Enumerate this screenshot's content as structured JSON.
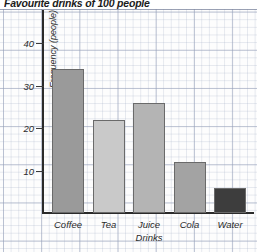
{
  "title": "Favourite drinks of 100 people",
  "chart_data": {
    "type": "bar",
    "title": "Favourite drinks of 100 people",
    "xlabel": "",
    "ylabel": "Frequency (people)",
    "categories": [
      "Coffee",
      "Tea",
      "Juice Drinks",
      "Cola",
      "Water"
    ],
    "values": [
      34,
      22,
      26,
      12,
      6
    ],
    "ylim": [
      0,
      45
    ],
    "ytick_labels": [
      "10",
      "20",
      "30",
      "40"
    ],
    "yticks": [
      10,
      20,
      30,
      40
    ],
    "minor_gridline_step": 2,
    "major_gridline_step": 10,
    "grid": true,
    "legend": false,
    "bar_colors": [
      "#9a9a9a",
      "#c9c9c9",
      "#b4b4b4",
      "#a3a3a3",
      "#3d3d3d"
    ],
    "bar_border_color": "#6a6a6a",
    "axis_color": "#2a2a2a",
    "background": "#fdfdfd"
  },
  "x_axis_labels": [
    {
      "line1": "Coffee",
      "line2": ""
    },
    {
      "line1": "Tea",
      "line2": ""
    },
    {
      "line1": "Juice",
      "line2": "Drinks"
    },
    {
      "line1": "Cola",
      "line2": ""
    },
    {
      "line1": "Water",
      "line2": ""
    }
  ],
  "y_axis": {
    "title": "Frequency (people)",
    "ticks": [
      {
        "label": "10",
        "value": 10
      },
      {
        "label": "20",
        "value": 20
      },
      {
        "label": "30",
        "value": 30
      },
      {
        "label": "40",
        "value": 40
      }
    ]
  }
}
